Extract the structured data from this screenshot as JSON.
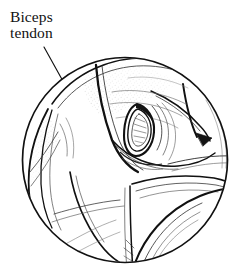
{
  "figure": {
    "name": "arthroscopic-view-biceps-tendon",
    "caption_labels": [
      {
        "id": "biceps-tendon",
        "line1": "Biceps",
        "line2": "tendon",
        "x": 10,
        "y": 22,
        "line_height": 16
      }
    ],
    "leader_line": {
      "name": "leader-line-biceps-tendon",
      "from_x": 44,
      "from_y": 47,
      "to_x": 69,
      "to_y": 92
    },
    "viewport_circle": {
      "cx": 125,
      "cy": 160,
      "r": 103,
      "stroke": "#111111",
      "stroke_width": 1.6,
      "fill": "#ffffff"
    },
    "colors": {
      "ink": "#111111",
      "ink_soft": "#333333",
      "ink_light": "#6a6a6a",
      "paper": "#ffffff",
      "stipple": "#555555"
    },
    "regions": [
      {
        "id": "humeral-head-superior",
        "description": "upper dome of humeral head with stipple shading"
      },
      {
        "id": "bicipital-groove",
        "description": "dark notch containing the biceps tendon"
      },
      {
        "id": "tendon-oval",
        "description": "almond shaped long head of biceps tendon"
      },
      {
        "id": "left-crescent-stipple",
        "description": "stippled crescent along left capsule margin"
      },
      {
        "id": "subscapularis-band",
        "description": "broad band crossing lower right of field"
      },
      {
        "id": "inferior-recess",
        "description": "lower rounded recess of joint"
      }
    ]
  }
}
